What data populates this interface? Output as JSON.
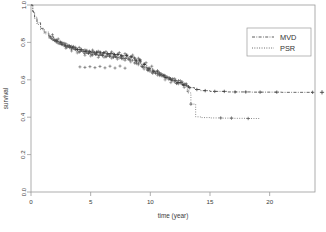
{
  "chart_data": {
    "type": "line",
    "title": "",
    "xlabel": "time (year)",
    "ylabel": "survival",
    "xlim": [
      0,
      23.8
    ],
    "ylim": [
      0.0,
      1.0
    ],
    "xticks": [
      0,
      5,
      10,
      15,
      20
    ],
    "xticklabels": [
      "0",
      "5",
      "10",
      "15",
      "20"
    ],
    "yticks": [
      0.0,
      0.2,
      0.4,
      0.6,
      0.8,
      1.0
    ],
    "yticklabels": [
      "0.0",
      "0.2",
      "0.4",
      "0.6",
      "0.8",
      "1.0"
    ],
    "grid": false,
    "legend_position": "top-right",
    "censor_marker": "+",
    "series": [
      {
        "name": "MVD",
        "linestyle": "dashdot",
        "color": "#333333",
        "x": [
          0,
          0.15,
          0.3,
          0.5,
          0.8,
          1.1,
          1.5,
          1.9,
          2.3,
          2.8,
          3.3,
          3.8,
          4.4,
          5.0,
          5.6,
          6.2,
          6.9,
          7.5,
          8.1,
          8.7,
          9.2,
          9.7,
          10.2,
          10.7,
          11.2,
          11.7,
          12.2,
          12.7,
          13.2,
          13.7,
          14.2,
          15.0,
          16.5,
          18.5,
          21.0,
          23.6
        ],
        "y": [
          1.0,
          0.965,
          0.935,
          0.905,
          0.875,
          0.855,
          0.83,
          0.812,
          0.798,
          0.782,
          0.772,
          0.762,
          0.752,
          0.748,
          0.744,
          0.74,
          0.735,
          0.73,
          0.722,
          0.705,
          0.682,
          0.662,
          0.645,
          0.63,
          0.612,
          0.598,
          0.585,
          0.572,
          0.558,
          0.548,
          0.542,
          0.538,
          0.535,
          0.534,
          0.533,
          0.533
        ],
        "censor_x": [
          1.6,
          2.1,
          2.5,
          2.9,
          3.2,
          3.5,
          3.9,
          4.2,
          4.6,
          4.9,
          5.2,
          5.5,
          5.8,
          6.1,
          6.4,
          6.7,
          7.0,
          7.3,
          7.6,
          8.0,
          8.4,
          8.8,
          9.1,
          9.5,
          9.9,
          10.3,
          10.8,
          11.3,
          11.8,
          12.3,
          12.8,
          13.3,
          13.9,
          14.6,
          15.4,
          16.2,
          17.1,
          18.0,
          19.2,
          20.6,
          23.6
        ]
      },
      {
        "name": "PSR",
        "linestyle": "dotted",
        "color": "#555555",
        "x": [
          0,
          0.15,
          0.3,
          0.5,
          0.8,
          1.1,
          1.5,
          1.9,
          2.3,
          2.8,
          3.3,
          3.8,
          4.4,
          5.0,
          5.6,
          6.2,
          6.9,
          7.5,
          8.1,
          8.7,
          9.2,
          9.7,
          10.2,
          10.7,
          11.2,
          11.7,
          12.2,
          12.7,
          13.1,
          13.4,
          13.8,
          14.2,
          15.0,
          16.0,
          17.0,
          18.2,
          19.2
        ],
        "y": [
          1.0,
          0.96,
          0.928,
          0.896,
          0.868,
          0.846,
          0.822,
          0.805,
          0.79,
          0.775,
          0.765,
          0.752,
          0.742,
          0.736,
          0.73,
          0.726,
          0.72,
          0.714,
          0.706,
          0.69,
          0.668,
          0.65,
          0.636,
          0.622,
          0.608,
          0.596,
          0.586,
          0.57,
          0.53,
          0.47,
          0.402,
          0.398,
          0.396,
          0.395,
          0.394,
          0.393,
          0.393
        ],
        "censor_x": [
          1.7,
          2.2,
          2.6,
          3.0,
          3.4,
          3.7,
          4.1,
          4.5,
          4.8,
          5.1,
          5.4,
          5.7,
          6.0,
          6.3,
          6.6,
          6.9,
          7.2,
          7.6,
          7.9,
          8.3,
          8.7,
          9.0,
          9.4,
          9.8,
          10.2,
          10.6,
          11.1,
          11.6,
          12.1,
          12.6,
          13.0,
          13.4,
          15.9,
          16.8,
          18.2
        ]
      }
    ],
    "outside_marker": {
      "x": 23.6,
      "y": 0.533,
      "symbol": "+"
    }
  },
  "legend": {
    "entries": [
      {
        "label": "MVD",
        "style": "dash-dot"
      },
      {
        "label": "PSR",
        "style": "dotted"
      }
    ]
  },
  "axes": {
    "x_title": "time (year)",
    "y_title": "survival"
  }
}
